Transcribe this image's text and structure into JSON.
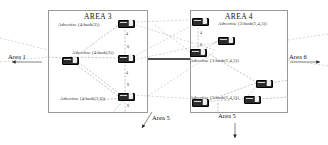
{
  "diagram": {
    "type": "network-topology",
    "width": 328,
    "height": 145,
    "background": "#ffffff",
    "line_color": "#8c8c8c",
    "node_color": "#2b2b2b",
    "box_border_color": "#9a9a9a"
  },
  "areas": [
    {
      "id": "area-3",
      "title": "AREA 3",
      "box": {
        "x": 48,
        "y": 10,
        "w": 100,
        "h": 103
      },
      "title_pos": {
        "x": 68,
        "y": 12
      }
    },
    {
      "id": "area-4",
      "title": "AREA 4",
      "box": {
        "x": 190,
        "y": 10,
        "w": 98,
        "h": 103
      },
      "title_pos": {
        "x": 212,
        "y": 12
      }
    }
  ],
  "advertise_labels": [
    {
      "id": "adv-a3-top",
      "text": "Advertise (4:hash(3))",
      "x": 58,
      "y": 22
    },
    {
      "id": "adv-a3-mid",
      "text": "Advertise (4:hash(3))",
      "x": 72,
      "y": 50
    },
    {
      "id": "adv-a3-bottom",
      "text": "Advertise (4:hash(3,6))",
      "x": 60,
      "y": 96
    },
    {
      "id": "adv-a4-top",
      "text": "Advertise (3:hash(1,4,5))",
      "x": 218,
      "y": 21
    },
    {
      "id": "adv-a4-mid",
      "text": "Advertise (3:hash(1,4,5))",
      "x": 190,
      "y": 58
    },
    {
      "id": "adv-a4-bottom",
      "text": "Advertise (3:hash(1,4,5))",
      "x": 190,
      "y": 95
    }
  ],
  "edge_labels": [
    {
      "id": "area-1",
      "text": "Area 1",
      "x": 8,
      "y": 53,
      "arrow": "left"
    },
    {
      "id": "area-6",
      "text": "Area 6",
      "x": 289,
      "y": 53,
      "arrow": "right"
    },
    {
      "id": "area-5-left",
      "text": "Area 5",
      "x": 143,
      "y": 117,
      "arrow": "down-left"
    },
    {
      "id": "area-5-right",
      "text": "Area 5",
      "x": 222,
      "y": 116,
      "arrow": "down"
    }
  ],
  "routers": [
    {
      "id": "r-a3-1",
      "x": 118,
      "y": 20
    },
    {
      "id": "r-a3-2",
      "x": 62,
      "y": 57
    },
    {
      "id": "r-a3-3",
      "x": 118,
      "y": 55
    },
    {
      "id": "r-a3-4",
      "x": 118,
      "y": 93
    },
    {
      "id": "r-a4-1",
      "x": 192,
      "y": 18
    },
    {
      "id": "r-a4-2",
      "x": 218,
      "y": 37
    },
    {
      "id": "r-a4-3",
      "x": 190,
      "y": 49
    },
    {
      "id": "r-a4-4",
      "x": 256,
      "y": 80
    },
    {
      "id": "r-a4-5",
      "x": 244,
      "y": 96
    },
    {
      "id": "r-a4-6",
      "x": 192,
      "y": 99
    }
  ],
  "link_numbers": [
    {
      "id": "n1",
      "text": "4",
      "x": 126,
      "y": 31
    },
    {
      "id": "n2",
      "text": "8",
      "x": 127,
      "y": 44
    },
    {
      "id": "n3",
      "text": "4",
      "x": 126,
      "y": 70
    },
    {
      "id": "n4",
      "text": "8",
      "x": 127,
      "y": 82
    },
    {
      "id": "n5",
      "text": "8",
      "x": 127,
      "y": 103
    },
    {
      "id": "n6",
      "text": "4",
      "x": 200,
      "y": 30
    },
    {
      "id": "n7",
      "text": "8",
      "x": 200,
      "y": 42
    }
  ]
}
